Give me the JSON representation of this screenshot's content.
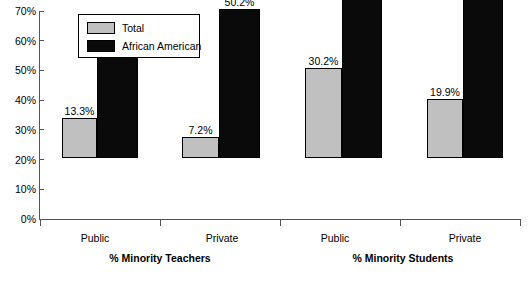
{
  "chart_data": {
    "type": "bar",
    "title": "",
    "subtitle": "",
    "xlabel": "",
    "ylabel": "",
    "ylim": [
      0,
      70
    ],
    "grid": false,
    "legend_position": "top-left",
    "y_ticks": [
      "0%",
      "10%",
      "20%",
      "30%",
      "40%",
      "50%",
      "60%",
      "70%"
    ],
    "y_tick_values": [
      0,
      10,
      20,
      30,
      40,
      50,
      60,
      70
    ],
    "categories": [
      "Public",
      "Private",
      "Public",
      "Private"
    ],
    "groups": [
      {
        "title": "% Minority Teachers",
        "categories": [
          "Public",
          "Private"
        ]
      },
      {
        "title": "% Minority Students",
        "categories": [
          "Public",
          "Private"
        ]
      }
    ],
    "series": [
      {
        "name": "Total",
        "color": "#c0c0c0",
        "values": [
          13.3,
          7.2,
          30.2,
          19.9
        ],
        "labels": [
          "13.3%",
          "7.2%",
          "30.2%",
          "19.9%"
        ]
      },
      {
        "name": "African American",
        "color": "#0a0a0a",
        "values": [
          41.3,
          50.2,
          66.8,
          69.7
        ],
        "labels": [
          "41.3%",
          "50.2%",
          "66.8%",
          "69.7%"
        ]
      }
    ]
  },
  "legend": {
    "items": [
      {
        "label": "Total",
        "color": "#c0c0c0"
      },
      {
        "label": "African American",
        "color": "#0a0a0a"
      }
    ]
  },
  "axis": {
    "color": "#555555"
  }
}
